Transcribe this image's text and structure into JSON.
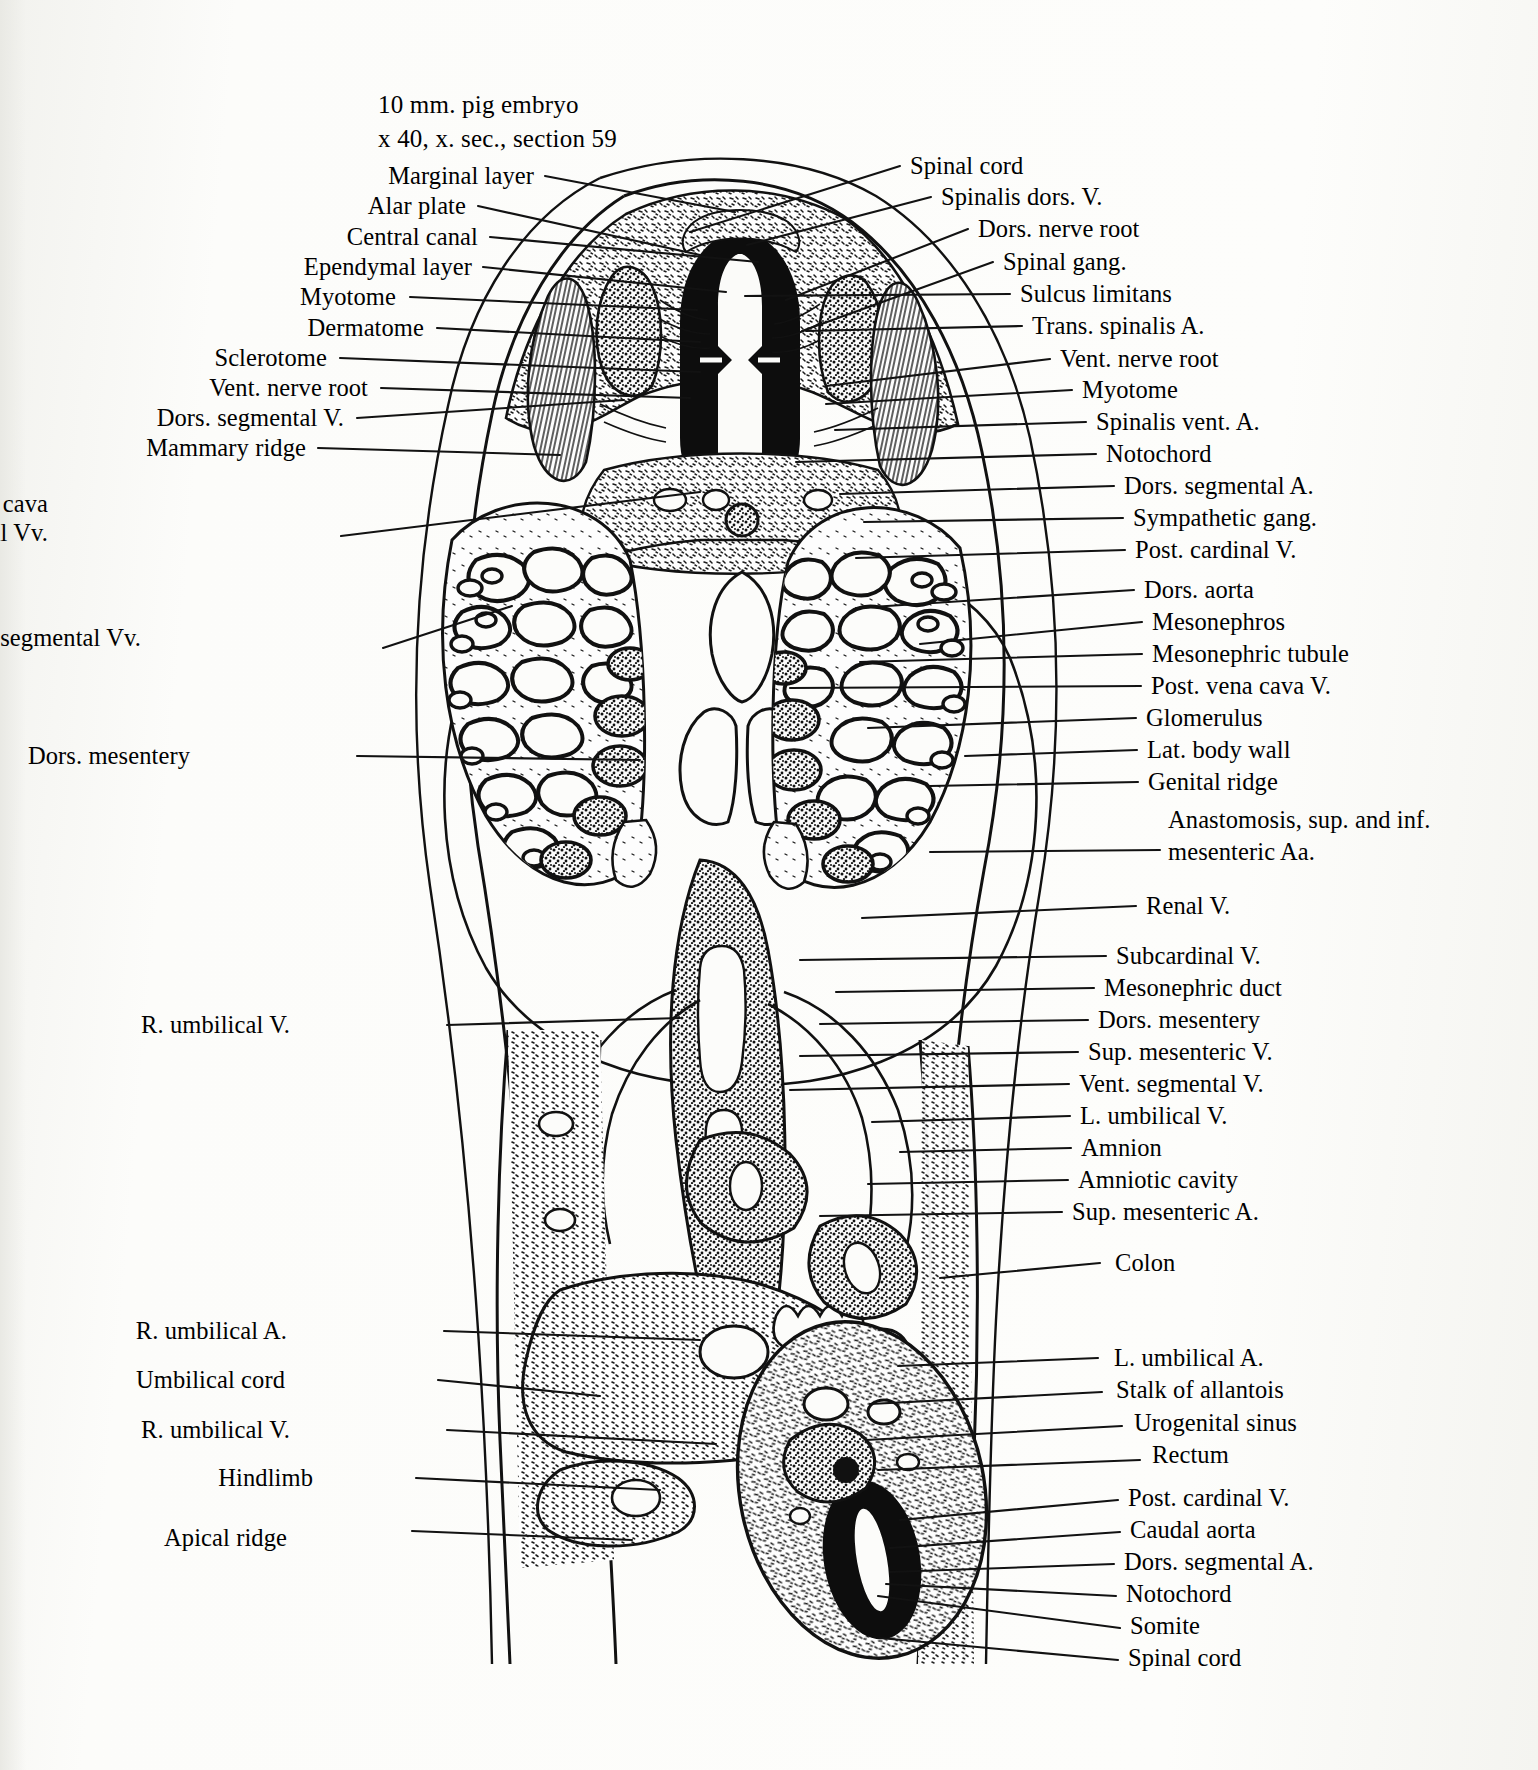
{
  "figure": {
    "caption_line1": "10 mm. pig embryo",
    "caption_line2": "x 40, x. sec., section 59",
    "specimen": "pig embryo",
    "length_mm": 10,
    "magnification": "x 40",
    "section_type": "x. sec.",
    "section_number": 59,
    "drawing_style": "ink line drawing, stippled histological cross-section",
    "ink_color": "#111111",
    "paper_color": "#fbfbf9"
  },
  "labels_left": [
    {
      "text": "Marginal layer",
      "x": 534,
      "y": 178,
      "lx": 545,
      "ly": 176,
      "tx": 735,
      "ty": 212
    },
    {
      "text": "Alar plate",
      "x": 466,
      "y": 208,
      "lx": 478,
      "ly": 206,
      "tx": 700,
      "ty": 255
    },
    {
      "text": "Central canal",
      "x": 478,
      "y": 239,
      "lx": 490,
      "ly": 237,
      "tx": 758,
      "ty": 262
    },
    {
      "text": "Ependymal layer",
      "x": 472,
      "y": 269,
      "lx": 483,
      "ly": 267,
      "tx": 726,
      "ty": 292
    },
    {
      "text": "Myotome",
      "x": 396,
      "y": 299,
      "lx": 410,
      "ly": 297,
      "tx": 697,
      "ty": 310
    },
    {
      "text": "Dermatome",
      "x": 424,
      "y": 330,
      "lx": 437,
      "ly": 328,
      "tx": 700,
      "ty": 342
    },
    {
      "text": "Sclerotome",
      "x": 327,
      "y": 360,
      "lx": 340,
      "ly": 358,
      "tx": 700,
      "ty": 372
    },
    {
      "text": "Vent. nerve root",
      "x": 368,
      "y": 390,
      "lx": 381,
      "ly": 388,
      "tx": 690,
      "ty": 398
    },
    {
      "text": "Dors. segmental V.",
      "x": 344,
      "y": 420,
      "lx": 357,
      "ly": 418,
      "tx": 624,
      "ty": 400
    },
    {
      "text": "Mammary ridge",
      "x": 306,
      "y": 450,
      "lx": 318,
      "ly": 448,
      "tx": 560,
      "ty": 455
    },
    {
      "text": "Anastomosis, post. vena cava",
      "x": 48,
      "y": 506,
      "lx": 341,
      "ly": 536,
      "tx": 700,
      "ty": 492
    },
    {
      "text": "and post. cardinal Vv.",
      "x": 48,
      "y": 535,
      "lx": null,
      "ly": null,
      "tx": null,
      "ty": null
    },
    {
      "text": "Vent. segmental Vv.",
      "x": 141,
      "y": 640,
      "lx": 383,
      "ly": 648,
      "tx": 512,
      "ty": 606
    },
    {
      "text": "Dors. mesentery",
      "x": 190,
      "y": 758,
      "lx": 357,
      "ly": 756,
      "tx": 640,
      "ty": 760
    },
    {
      "text": "R. umbilical V.",
      "x": 290,
      "y": 1027,
      "lx": 447,
      "ly": 1025,
      "tx": 680,
      "ty": 1018
    },
    {
      "text": "R. umbilical A.",
      "x": 287,
      "y": 1333,
      "lx": 444,
      "ly": 1331,
      "tx": 700,
      "ty": 1340
    },
    {
      "text": "Umbilical cord",
      "x": 285,
      "y": 1382,
      "lx": 438,
      "ly": 1380,
      "tx": 600,
      "ty": 1396
    },
    {
      "text": "R. umbilical V.",
      "x": 290,
      "y": 1432,
      "lx": 447,
      "ly": 1430,
      "tx": 716,
      "ty": 1444
    },
    {
      "text": "Hindlimb",
      "x": 313,
      "y": 1480,
      "lx": 416,
      "ly": 1478,
      "tx": 660,
      "ty": 1490
    },
    {
      "text": "Apical ridge",
      "x": 287,
      "y": 1540,
      "lx": 412,
      "ly": 1531,
      "tx": 632,
      "ty": 1540
    }
  ],
  "labels_right": [
    {
      "text": "Spinal cord",
      "x": 910,
      "y": 168,
      "lx": 900,
      "ly": 166,
      "tx": 690,
      "ty": 232
    },
    {
      "text": "Spinalis dors. V.",
      "x": 941,
      "y": 199,
      "lx": 931,
      "ly": 197,
      "tx": 747,
      "ty": 245
    },
    {
      "text": "Dors. nerve root",
      "x": 978,
      "y": 231,
      "lx": 968,
      "ly": 229,
      "tx": 786,
      "ty": 300
    },
    {
      "text": "Spinal gang.",
      "x": 1003,
      "y": 264,
      "lx": 993,
      "ly": 262,
      "tx": 802,
      "ty": 331
    },
    {
      "text": "Sulcus limitans",
      "x": 1020,
      "y": 296,
      "lx": 1010,
      "ly": 294,
      "tx": 745,
      "ty": 296
    },
    {
      "text": "Trans. spinalis A.",
      "x": 1032,
      "y": 328,
      "lx": 1022,
      "ly": 326,
      "tx": 806,
      "ty": 331
    },
    {
      "text": "Vent. nerve root",
      "x": 1060,
      "y": 361,
      "lx": 1050,
      "ly": 359,
      "tx": 826,
      "ty": 386
    },
    {
      "text": "Myotome",
      "x": 1082,
      "y": 392,
      "lx": 1072,
      "ly": 390,
      "tx": 826,
      "ty": 404
    },
    {
      "text": "Spinalis vent. A.",
      "x": 1096,
      "y": 424,
      "lx": 1086,
      "ly": 422,
      "tx": 835,
      "ty": 430
    },
    {
      "text": "Notochord",
      "x": 1106,
      "y": 456,
      "lx": 1096,
      "ly": 454,
      "tx": 796,
      "ty": 462
    },
    {
      "text": "Dors. segmental A.",
      "x": 1124,
      "y": 488,
      "lx": 1114,
      "ly": 486,
      "tx": 840,
      "ty": 494
    },
    {
      "text": "Sympathetic gang.",
      "x": 1133,
      "y": 520,
      "lx": 1123,
      "ly": 518,
      "tx": 864,
      "ty": 522
    },
    {
      "text": "Post. cardinal V.",
      "x": 1135,
      "y": 552,
      "lx": 1125,
      "ly": 550,
      "tx": 856,
      "ty": 558
    },
    {
      "text": "Dors. aorta",
      "x": 1144,
      "y": 592,
      "lx": 1134,
      "ly": 590,
      "tx": 856,
      "ty": 608
    },
    {
      "text": "Mesonephros",
      "x": 1152,
      "y": 624,
      "lx": 1142,
      "ly": 622,
      "tx": 920,
      "ty": 644
    },
    {
      "text": "Mesonephric tubule",
      "x": 1152,
      "y": 656,
      "lx": 1142,
      "ly": 654,
      "tx": 860,
      "ty": 662
    },
    {
      "text": "Post. vena cava V.",
      "x": 1151,
      "y": 688,
      "lx": 1141,
      "ly": 686,
      "tx": 790,
      "ty": 688
    },
    {
      "text": "Glomerulus",
      "x": 1146,
      "y": 720,
      "lx": 1136,
      "ly": 718,
      "tx": 868,
      "ty": 728
    },
    {
      "text": "Lat. body wall",
      "x": 1147,
      "y": 752,
      "lx": 1137,
      "ly": 750,
      "tx": 965,
      "ty": 756
    },
    {
      "text": "Genital ridge",
      "x": 1148,
      "y": 784,
      "lx": 1138,
      "ly": 782,
      "tx": 930,
      "ty": 786
    },
    {
      "text": "Anastomosis, sup. and inf.",
      "x": 1168,
      "y": 822,
      "lx": null,
      "ly": null,
      "tx": null,
      "ty": null
    },
    {
      "text": "mesenteric Aa.",
      "x": 1168,
      "y": 854,
      "lx": 1160,
      "ly": 850,
      "tx": 930,
      "ty": 852
    },
    {
      "text": "Renal V.",
      "x": 1146,
      "y": 908,
      "lx": 1136,
      "ly": 906,
      "tx": 862,
      "ty": 918
    },
    {
      "text": "Subcardinal V.",
      "x": 1116,
      "y": 958,
      "lx": 1106,
      "ly": 956,
      "tx": 800,
      "ty": 960
    },
    {
      "text": "Mesonephric duct",
      "x": 1104,
      "y": 990,
      "lx": 1094,
      "ly": 988,
      "tx": 836,
      "ty": 992
    },
    {
      "text": "Dors. mesentery",
      "x": 1098,
      "y": 1022,
      "lx": 1088,
      "ly": 1020,
      "tx": 820,
      "ty": 1024
    },
    {
      "text": "Sup. mesenteric V.",
      "x": 1088,
      "y": 1054,
      "lx": 1078,
      "ly": 1052,
      "tx": 800,
      "ty": 1056
    },
    {
      "text": "Vent. segmental V.",
      "x": 1079,
      "y": 1086,
      "lx": 1069,
      "ly": 1084,
      "tx": 790,
      "ty": 1090
    },
    {
      "text": "L. umbilical V.",
      "x": 1080,
      "y": 1118,
      "lx": 1070,
      "ly": 1116,
      "tx": 872,
      "ty": 1122
    },
    {
      "text": "Amnion",
      "x": 1081,
      "y": 1150,
      "lx": 1071,
      "ly": 1148,
      "tx": 900,
      "ty": 1152
    },
    {
      "text": "Amniotic cavity",
      "x": 1078,
      "y": 1182,
      "lx": 1068,
      "ly": 1180,
      "tx": 868,
      "ty": 1184
    },
    {
      "text": "Sup. mesenteric A.",
      "x": 1072,
      "y": 1214,
      "lx": 1062,
      "ly": 1212,
      "tx": 820,
      "ty": 1216
    },
    {
      "text": "Colon",
      "x": 1115,
      "y": 1265,
      "lx": 1100,
      "ly": 1263,
      "tx": 940,
      "ty": 1278
    },
    {
      "text": "L. umbilical A.",
      "x": 1114,
      "y": 1360,
      "lx": 1098,
      "ly": 1358,
      "tx": 898,
      "ty": 1366
    },
    {
      "text": "Stalk of allantois",
      "x": 1116,
      "y": 1392,
      "lx": 1102,
      "ly": 1392,
      "tx": 870,
      "ty": 1404
    },
    {
      "text": "Urogenital sinus",
      "x": 1134,
      "y": 1425,
      "lx": 1122,
      "ly": 1426,
      "tx": 866,
      "ty": 1440
    },
    {
      "text": "Rectum",
      "x": 1152,
      "y": 1457,
      "lx": 1140,
      "ly": 1460,
      "tx": 878,
      "ty": 1470
    },
    {
      "text": "Post. cardinal V.",
      "x": 1128,
      "y": 1500,
      "lx": 1118,
      "ly": 1500,
      "tx": 900,
      "ty": 1520
    },
    {
      "text": "Caudal aorta",
      "x": 1130,
      "y": 1532,
      "lx": 1120,
      "ly": 1532,
      "tx": 890,
      "ty": 1548
    },
    {
      "text": "Dors. segmental A.",
      "x": 1124,
      "y": 1564,
      "lx": 1114,
      "ly": 1564,
      "tx": 890,
      "ty": 1572
    },
    {
      "text": "Notochord",
      "x": 1126,
      "y": 1596,
      "lx": 1116,
      "ly": 1596,
      "tx": 886,
      "ty": 1584
    },
    {
      "text": "Somite",
      "x": 1130,
      "y": 1628,
      "lx": 1120,
      "ly": 1628,
      "tx": 878,
      "ty": 1596
    },
    {
      "text": "Spinal cord",
      "x": 1128,
      "y": 1660,
      "lx": 1118,
      "ly": 1660,
      "tx": 880,
      "ty": 1638
    }
  ],
  "structures": [
    "Spinal cord",
    "Marginal layer",
    "Alar plate",
    "Central canal",
    "Ependymal layer",
    "Sulcus limitans",
    "Dors. nerve root",
    "Vent. nerve root",
    "Spinal gang.",
    "Spinalis dors. V.",
    "Spinalis vent. A.",
    "Trans. spinalis A.",
    "Myotome",
    "Dermatome",
    "Sclerotome",
    "Somite",
    "Notochord",
    "Dors. segmental V.",
    "Dors. segmental A.",
    "Mammary ridge",
    "Sympathetic gang.",
    "Post. cardinal V.",
    "Dors. aorta",
    "Caudal aorta",
    "Mesonephros",
    "Mesonephric tubule",
    "Mesonephric duct",
    "Glomerulus",
    "Post. vena cava V.",
    "Subcardinal V.",
    "Renal V.",
    "Lat. body wall",
    "Genital ridge",
    "Dors. mesentery",
    "Sup. mesenteric V.",
    "Sup. mesenteric A.",
    "Vent. segmental V.",
    "Vent. segmental Vv.",
    "L. umbilical V.",
    "R. umbilical V.",
    "L. umbilical A.",
    "R. umbilical A.",
    "Umbilical cord",
    "Stalk of allantois",
    "Urogenital sinus",
    "Rectum",
    "Colon",
    "Amnion",
    "Amniotic cavity",
    "Hindlimb",
    "Apical ridge",
    "Anastomosis, post. vena cava and post. cardinal Vv.",
    "Anastomosis, sup. and inf. mesenteric Aa."
  ]
}
